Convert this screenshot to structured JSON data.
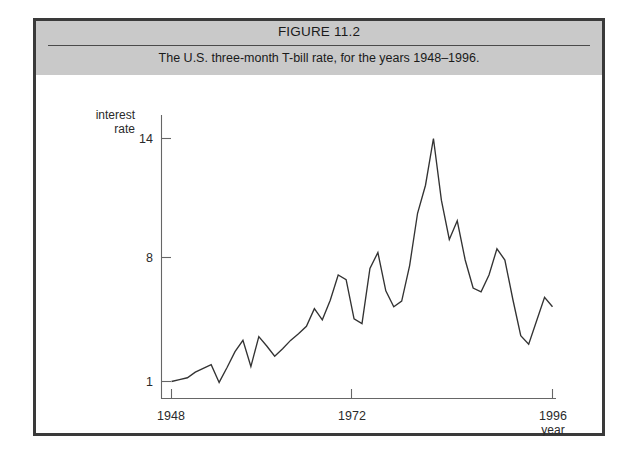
{
  "figure": {
    "title": "FIGURE 11.2",
    "subtitle": "The U.S. three-month T-bill rate, for the years 1948–1996."
  },
  "chart_data": {
    "type": "line",
    "title": "The U.S. three-month T-bill rate, for the years 1948–1996.",
    "xlabel": "year",
    "ylabel": "interest rate",
    "xlim": [
      1948,
      1996
    ],
    "ylim": [
      1,
      14
    ],
    "xticks": [
      1948,
      1972,
      1996
    ],
    "xticklabels": [
      "1948",
      "1972",
      "1996"
    ],
    "yticks": [
      1,
      8,
      14
    ],
    "yticklabels": [
      "1",
      "8",
      "14"
    ],
    "grid": false,
    "legend": false,
    "series": [
      {
        "name": "U.S. three-month T-bill rate",
        "color": "#333333",
        "x": [
          1948,
          1949,
          1950,
          1951,
          1952,
          1953,
          1954,
          1955,
          1956,
          1957,
          1958,
          1959,
          1960,
          1961,
          1962,
          1963,
          1964,
          1965,
          1966,
          1967,
          1968,
          1969,
          1970,
          1971,
          1972,
          1973,
          1974,
          1975,
          1976,
          1977,
          1978,
          1979,
          1980,
          1981,
          1982,
          1983,
          1984,
          1985,
          1986,
          1987,
          1988,
          1989,
          1990,
          1991,
          1992,
          1993,
          1994,
          1995,
          1996
        ],
        "values": [
          1.0,
          1.1,
          1.2,
          1.5,
          1.7,
          1.9,
          0.95,
          1.75,
          2.6,
          3.2,
          1.8,
          3.4,
          2.9,
          2.35,
          2.75,
          3.2,
          3.55,
          3.95,
          4.9,
          4.3,
          5.35,
          6.7,
          6.45,
          4.35,
          4.1,
          7.05,
          7.9,
          5.85,
          5.0,
          5.3,
          7.2,
          10.0,
          11.5,
          14.0,
          10.7,
          8.6,
          9.6,
          7.5,
          6.0,
          5.8,
          6.7,
          8.1,
          7.5,
          5.4,
          3.45,
          3.0,
          4.25,
          5.5,
          5.0
        ]
      }
    ]
  },
  "axis_labels": {
    "y_line1": "interest",
    "y_line2": "rate",
    "x_title": "year"
  }
}
